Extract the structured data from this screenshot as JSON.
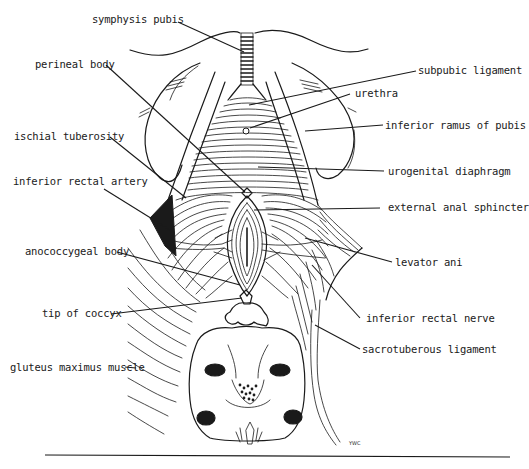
{
  "figure": {
    "signature": "YWC",
    "labels": {
      "symphysis_pubis": "symphysis pubis",
      "perineal_body": "perineal body",
      "subpubic_ligament": "subpubic ligament",
      "urethra": "urethra",
      "inferior_ramus_of_pubis": "inferior ramus of pubis",
      "ischial_tuberosity": "ischial tuberosity",
      "urogenital_diaphragm": "urogenital diaphragm",
      "inferior_rectal_artery": "inferior rectal artery",
      "external_anal_sphincter": "external anal sphincter",
      "anococcygeal_body": "anococcygeal body",
      "levator_ani": "levator ani",
      "tip_of_coccyx": "tip of coccyx",
      "inferior_rectal_nerve": "inferior rectal nerve",
      "gluteus_maximus_muscle": "gluteus maximus muscle",
      "sacrotuberous_ligament": "sacrotuberous ligament"
    },
    "colors": {
      "ink": "#1a1a1a",
      "background": "#ffffff"
    }
  }
}
